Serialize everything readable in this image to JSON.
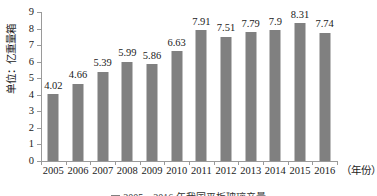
{
  "chart_data": {
    "type": "bar",
    "title": "",
    "subtitle": "",
    "xlabel": "（年份）",
    "ylabel": "单位：亿重量箱",
    "categories": [
      "2005",
      "2006",
      "2007",
      "2008",
      "2009",
      "2010",
      "2011",
      "2012",
      "2013",
      "2014",
      "2015",
      "2016"
    ],
    "values": [
      4.02,
      4.66,
      5.39,
      5.99,
      5.86,
      6.63,
      7.91,
      7.51,
      7.79,
      7.9,
      8.31,
      7.74
    ],
    "value_labels": [
      "4.02",
      "4.66",
      "5.39",
      "5.99",
      "5.86",
      "6.63",
      "7.91",
      "7.51",
      "7.79",
      "7.9",
      "8.31",
      "7.74"
    ],
    "ylim": [
      0,
      9
    ],
    "ytick_labels": [
      "0",
      "1",
      "2",
      "3",
      "4",
      "5",
      "6",
      "7",
      "8",
      "9"
    ],
    "ytick_values": [
      0,
      1,
      2,
      3,
      4,
      5,
      6,
      7,
      8,
      9
    ],
    "grid": false,
    "legend_position": "none",
    "series": [
      {
        "name": "",
        "values": [
          4.02,
          4.66,
          5.39,
          5.99,
          5.86,
          6.63,
          7.91,
          7.51,
          7.79,
          7.9,
          8.31,
          7.74
        ],
        "color": "#808080"
      }
    ],
    "colors": {
      "bar": "#808080",
      "axis": "#9a9a9a",
      "text": "#1a1a1a",
      "background": "#ffffff"
    }
  },
  "caption": {
    "text": "2005—2016 年我国平板玻璃产量"
  }
}
